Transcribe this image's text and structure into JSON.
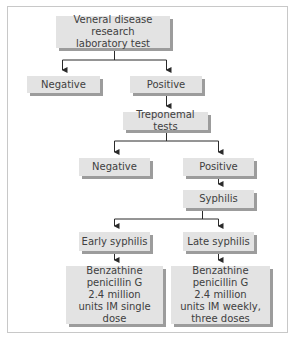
{
  "diagram": {
    "type": "flowchart",
    "title": "",
    "nodes": {
      "vdrl": {
        "label": "Veneral disease research\nlaboratory test"
      },
      "vdrl_negative": {
        "label": "Negative"
      },
      "vdrl_positive": {
        "label": "Positive"
      },
      "treponemal": {
        "label": "Treponemal tests"
      },
      "trep_negative": {
        "label": "Negative"
      },
      "trep_positive": {
        "label": "Positive"
      },
      "syphilis": {
        "label": "Syphilis"
      },
      "early": {
        "label": "Early syphilis"
      },
      "late": {
        "label": "Late syphilis"
      },
      "early_treatment": {
        "label": "Benzathine\npenicillin G\n2.4 million\nunits IM single dose"
      },
      "late_treatment": {
        "label": "Benzathine penicillin G\n2.4 million\nunits IM weekly,\nthree doses"
      }
    },
    "edges": [
      {
        "from": "vdrl",
        "to": "vdrl_negative"
      },
      {
        "from": "vdrl",
        "to": "vdrl_positive"
      },
      {
        "from": "vdrl_positive",
        "to": "treponemal"
      },
      {
        "from": "treponemal",
        "to": "trep_negative"
      },
      {
        "from": "treponemal",
        "to": "trep_positive"
      },
      {
        "from": "trep_positive",
        "to": "syphilis"
      },
      {
        "from": "syphilis",
        "to": "early"
      },
      {
        "from": "syphilis",
        "to": "late"
      },
      {
        "from": "early",
        "to": "early_treatment"
      },
      {
        "from": "late",
        "to": "late_treatment"
      }
    ],
    "colors": {
      "box_fill": "#e3e3e3",
      "box_shadow": "#9c9c9c",
      "line": "#2a2a2a",
      "frame_border": "#c8c8c8",
      "text": "#404040"
    }
  }
}
